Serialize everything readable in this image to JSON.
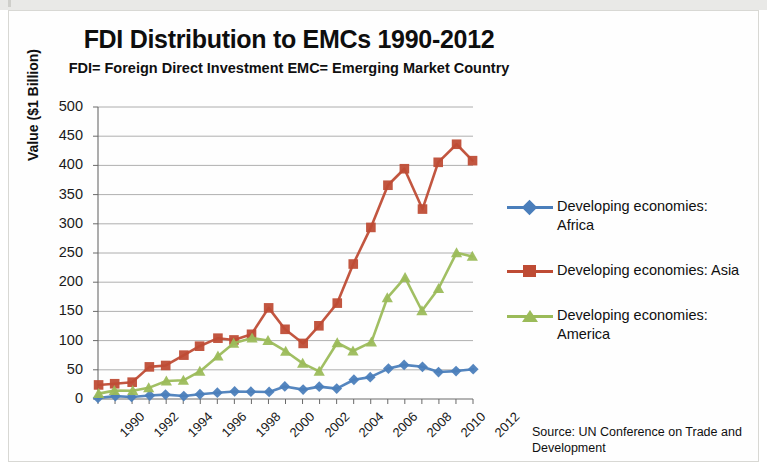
{
  "chart_data": {
    "type": "line",
    "title": "FDI Distribution to EMCs 1990-2012",
    "subtitle": "FDI= Foreign Direct Investment  EMC= Emerging Market Country",
    "xlabel": "",
    "ylabel": "Value ($1 Billion)",
    "ylim": [
      0,
      500
    ],
    "ytick_step": 50,
    "yticks": [
      "500",
      "450",
      "400",
      "350",
      "300",
      "250",
      "200",
      "150",
      "100",
      "50",
      "0"
    ],
    "grid": true,
    "legend_position": "right",
    "x": [
      1990,
      1991,
      1992,
      1993,
      1994,
      1995,
      1996,
      1997,
      1998,
      1999,
      2000,
      2001,
      2002,
      2003,
      2004,
      2005,
      2006,
      2007,
      2008,
      2009,
      2010,
      2011,
      2012
    ],
    "xticks": [
      "1990",
      "1992",
      "1994",
      "1996",
      "1998",
      "2000",
      "2002",
      "2004",
      "2006",
      "2008",
      "2010",
      "2012"
    ],
    "xtick_years": [
      1990,
      1992,
      1994,
      1996,
      1998,
      2000,
      2002,
      2004,
      2006,
      2008,
      2010,
      2012
    ],
    "series": [
      {
        "name": "Developing economies: Africa",
        "color": "#4A7EBB",
        "marker": "diamond",
        "values": [
          3,
          4,
          4,
          6,
          7,
          6,
          7,
          12,
          12,
          13,
          12,
          21,
          17,
          20,
          19,
          32,
          38,
          52,
          58,
          56,
          45,
          49,
          50
        ]
      },
      {
        "name": "Developing economies: Asia",
        "color": "#BE4B34",
        "marker": "square",
        "values": [
          25,
          25,
          30,
          54,
          58,
          75,
          90,
          105,
          100,
          112,
          155,
          120,
          95,
          125,
          165,
          230,
          295,
          365,
          395,
          325,
          405,
          437,
          407
        ]
      },
      {
        "name": "Developing economies: America",
        "color": "#9BBB59",
        "marker": "triangle",
        "values": [
          9,
          14,
          15,
          18,
          32,
          31,
          48,
          73,
          95,
          105,
          99,
          83,
          60,
          48,
          96,
          82,
          98,
          172,
          209,
          150,
          190,
          250,
          244
        ]
      }
    ],
    "source": "Source:  UN Conference on Trade and Development"
  },
  "legend": {
    "items": [
      {
        "label_line1": "Developing economies:",
        "label_line2": "Africa",
        "color": "#4A7EBB",
        "marker": "diamond"
      },
      {
        "label_line1": "Developing economies: Asia",
        "label_line2": "",
        "color": "#BE4B34",
        "marker": "square"
      },
      {
        "label_line1": "Developing economies:",
        "label_line2": "America",
        "color": "#9BBB59",
        "marker": "triangle"
      }
    ]
  }
}
